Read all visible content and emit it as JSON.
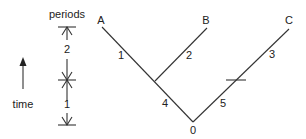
{
  "diagram": {
    "type": "phylogenetic-tree",
    "scale": {
      "title": "periods",
      "time_label": "time",
      "period_labels": [
        "2",
        "1"
      ]
    },
    "tree": {
      "leaves": [
        "A",
        "B",
        "C"
      ],
      "root_label": "0",
      "branch_labels": {
        "a": "1",
        "b": "2",
        "c": "3",
        "internal": "4",
        "root_to_c": "5"
      }
    },
    "colors": {
      "line": "#333333",
      "text": "#222222",
      "background": "#ffffff"
    }
  }
}
